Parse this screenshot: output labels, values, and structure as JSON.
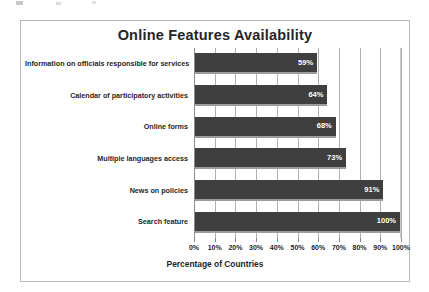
{
  "chart_data": {
    "type": "bar",
    "orientation": "horizontal",
    "title": "Online Features Availability",
    "xlabel": "Percentage of Countries",
    "ylabel": "",
    "xlim": [
      0,
      100
    ],
    "grid": true,
    "legend": false,
    "categories": [
      "Information on officials responsible for services",
      "Calendar of participatory activities",
      "Online forms",
      "Multiple languages access",
      "News on policies",
      "Search feature"
    ],
    "values": [
      59,
      64,
      68,
      73,
      91,
      100
    ],
    "data_labels": [
      "59%",
      "64%",
      "68%",
      "73%",
      "91%",
      "100%"
    ],
    "xticks": [
      0,
      10,
      20,
      30,
      40,
      50,
      60,
      70,
      80,
      90,
      100
    ],
    "xtick_labels": [
      "0%",
      "10%",
      "20%",
      "30%",
      "40%",
      "50%",
      "60%",
      "70%",
      "80%",
      "90%",
      "100%"
    ],
    "bar_color": "#3f3f3f",
    "bar_shadow_color": "#9d9d9d",
    "data_label_color": "#ffffff",
    "gridline_color": "#b0b0b0",
    "axis_color": "#8c8c8c",
    "frame_color": "#b9b9b9",
    "background_color": "#ffffff",
    "title_color": "#262626"
  }
}
